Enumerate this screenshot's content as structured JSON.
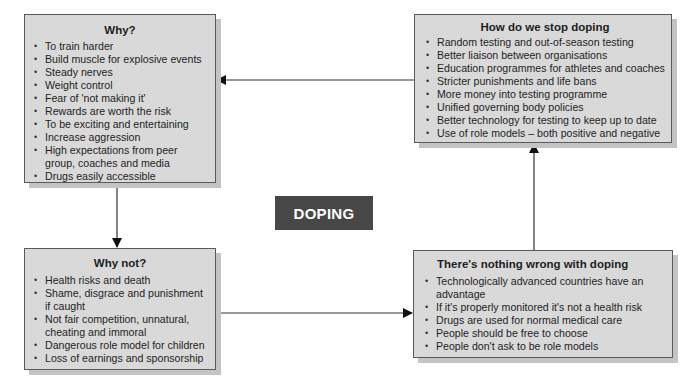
{
  "center": {
    "label": "DOPING",
    "fill": "#474747"
  },
  "colors": {
    "box_fill": "#d9d9d9",
    "box_border": "#5a5a5a",
    "shadow": "#c4c4c4"
  },
  "boxes": {
    "why": {
      "title": "Why?",
      "items": [
        "To train harder",
        "Build muscle for explosive events",
        "Steady nerves",
        "Weight control",
        "Fear of 'not making it'",
        "Rewards are worth the risk",
        "To be exciting and entertaining",
        "Increase aggression",
        "High expectations from peer group, coaches and media",
        "Drugs easily accessible"
      ]
    },
    "stop": {
      "title": "How do we stop doping",
      "items": [
        "Random testing and out-of-season testing",
        "Better liaison between organisations",
        "Education programmes for athletes and coaches",
        "Stricter punishments and life bans",
        "More money into testing programme",
        "Unified governing body policies",
        "Better technology for testing to keep up to date",
        "Use of role models – both positive and negative"
      ]
    },
    "whynot": {
      "title": "Why not?",
      "items": [
        "Health risks and death",
        "Shame, disgrace and punishment if caught",
        "Not fair competition, unnatural, cheating and immoral",
        "Dangerous role model for children",
        "Loss of earnings and sponsorship"
      ]
    },
    "nothing": {
      "title": "There's nothing wrong with doping",
      "items": [
        "Technologically advanced countries have an advantage",
        "If it's properly monitored it's not a health risk",
        "Drugs are used for normal medical care",
        "People should be free to choose",
        "People don't ask to be role models"
      ]
    }
  },
  "arrows": [
    {
      "from": "stop",
      "to": "why"
    },
    {
      "from": "why",
      "to": "whynot"
    },
    {
      "from": "whynot",
      "to": "nothing"
    },
    {
      "from": "nothing",
      "to": "stop"
    }
  ]
}
